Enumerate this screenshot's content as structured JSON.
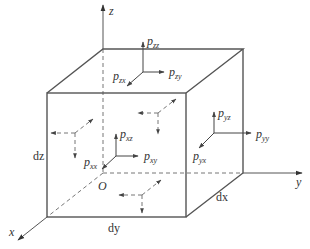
{
  "diagram": {
    "axes": {
      "x_label": "x",
      "y_label": "y",
      "z_label": "z",
      "origin_label": "O"
    },
    "dimensions": {
      "dx": "dx",
      "dy": "dy",
      "dz": "dz"
    },
    "top_face": {
      "p_zz": "zz",
      "p_zx": "zx",
      "p_zy": "zy"
    },
    "front_face": {
      "p_xz": "xz",
      "p_xx": "xx",
      "p_xy": "xy"
    },
    "right_face": {
      "p_yz": "yz",
      "p_yy": "yy",
      "p_yx": "yx"
    },
    "symbol": "p",
    "colors": {
      "line": "#555555",
      "text": "#333333",
      "background": "#ffffff"
    }
  }
}
